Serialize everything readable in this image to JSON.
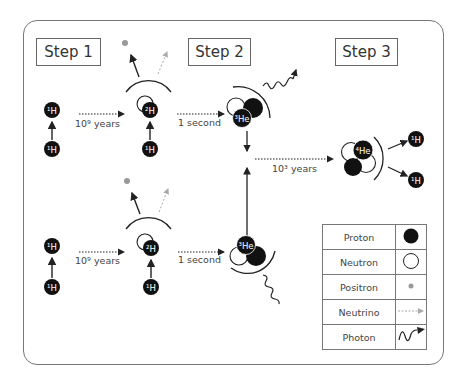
{
  "steps": [
    {
      "label": "Step 1"
    },
    {
      "label": "Step 2"
    },
    {
      "label": "Step 3"
    }
  ],
  "transitions": {
    "top_step1": "10⁹ years",
    "top_step2": "1 second",
    "bottom_step1": "10⁹ years",
    "bottom_step2": "1 second",
    "step3": "10³ years"
  },
  "nuclei": {
    "h1": "¹H",
    "h2": "²H",
    "he3": "³He",
    "he4": "⁴He"
  },
  "legend": [
    {
      "name": "Proton",
      "symbol": "filled-black-circle"
    },
    {
      "name": "Neutron",
      "symbol": "open-circle"
    },
    {
      "name": "Positron",
      "symbol": "small-grey-dot"
    },
    {
      "name": "Neutrino",
      "symbol": "dashed-grey-arrow"
    },
    {
      "name": "Photon",
      "symbol": "wavy-arrow"
    }
  ],
  "colors": {
    "proton": "#111111",
    "neutron": "#ffffff",
    "positron": "#999999",
    "neutrino": "#aaaaaa",
    "stroke": "#222222"
  }
}
